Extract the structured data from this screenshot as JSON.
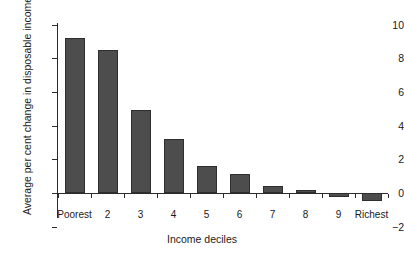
{
  "chart_data": {
    "type": "bar",
    "title": "",
    "xlabel": "Income deciles",
    "ylabel": "Average per cent change in disposable income",
    "categories": [
      "Poorest",
      "2",
      "3",
      "4",
      "5",
      "6",
      "7",
      "8",
      "9",
      "Richest"
    ],
    "values": [
      9.2,
      8.5,
      4.95,
      3.2,
      1.6,
      1.15,
      0.4,
      0.2,
      -0.25,
      -0.5
    ],
    "ylim": [
      -2,
      10
    ],
    "yticks": [
      "10",
      "8",
      "6",
      "4",
      "2",
      "0",
      "−2"
    ],
    "ytick_values": [
      10,
      8,
      6,
      4,
      2,
      0,
      -2
    ],
    "grid": false,
    "legend": "none",
    "bar_color": "#4d4d4d",
    "bar_border_color": "#2e2e2e",
    "axis_color": "#2b2b2b",
    "background": "#ffffff"
  }
}
